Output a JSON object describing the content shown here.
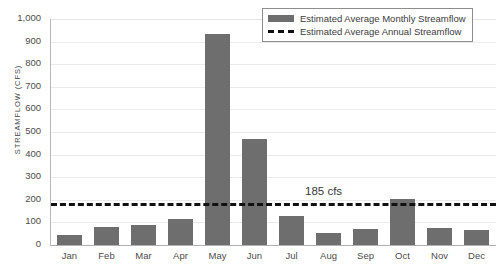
{
  "chart_data": {
    "type": "bar",
    "title": "",
    "xlabel": "",
    "ylabel": "STREAMFLOW  (CFS)",
    "ylim": [
      0,
      1000
    ],
    "ytick_step": 100,
    "grid": true,
    "legend_position": "top-right",
    "categories": [
      "Jan",
      "Feb",
      "Mar",
      "Apr",
      "May",
      "Jun",
      "Jul",
      "Aug",
      "Sep",
      "Oct",
      "Nov",
      "Dec"
    ],
    "ytick_labels": [
      "1,000",
      "900",
      "800",
      "700",
      "600",
      "500",
      "400",
      "300",
      "200",
      "100",
      "0"
    ],
    "series": [
      {
        "name": "Estimated Average Monthly Streamflow",
        "type": "bar",
        "color": "#6e6e6e",
        "values": [
          45,
          78,
          88,
          115,
          935,
          470,
          130,
          52,
          72,
          205,
          75,
          65
        ]
      },
      {
        "name": "Estimated Average Annual Streamflow",
        "type": "line",
        "style": "dashed",
        "color": "#111111",
        "value": 185
      }
    ],
    "annotations": [
      {
        "text": "185 cfs",
        "value": 185
      }
    ]
  },
  "legend": {
    "items": [
      {
        "label": "Estimated Average Monthly Streamflow",
        "swatch": "bar-swatch"
      },
      {
        "label": "Estimated Average Annual Streamflow",
        "swatch": "dashed-line-swatch"
      }
    ]
  },
  "colors": {
    "bar": "#6e6e6e",
    "annual_line": "#111111",
    "gridline": "#eceaea",
    "axis": "#b0b0b0",
    "text": "#4c4c4c"
  }
}
